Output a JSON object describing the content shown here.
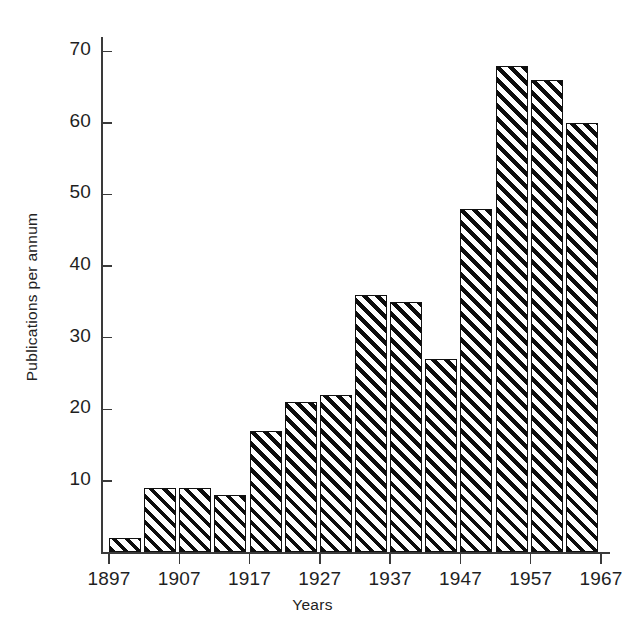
{
  "chart_data": {
    "type": "bar",
    "title": "",
    "xlabel": "Years",
    "ylabel": "Publications per annum",
    "categories": [
      "1897",
      "1902",
      "1907",
      "1912",
      "1917",
      "1922",
      "1927",
      "1932",
      "1937",
      "1942",
      "1947",
      "1952",
      "1957",
      "1962"
    ],
    "values": [
      2,
      9,
      9,
      8,
      17,
      21,
      22,
      36,
      35,
      27,
      48,
      68,
      66,
      60
    ],
    "ylim": [
      0,
      72
    ],
    "ytick_labels": [
      "10",
      "20",
      "30",
      "40",
      "50",
      "60",
      "70"
    ],
    "ytick_values": [
      10,
      20,
      30,
      40,
      50,
      60,
      70
    ],
    "xtick_labels": [
      "1897",
      "1907",
      "1917",
      "1927",
      "1937",
      "1947",
      "1957",
      "1967"
    ],
    "xtick_values": [
      1897,
      1907,
      1917,
      1927,
      1937,
      1947,
      1957,
      1967
    ],
    "grid": false,
    "legend": null,
    "bar_fill": "black-diagonal-hatch",
    "axis_color": "#3a3a3a",
    "bar_edge_color": "#111111",
    "background": "#ffffff"
  }
}
